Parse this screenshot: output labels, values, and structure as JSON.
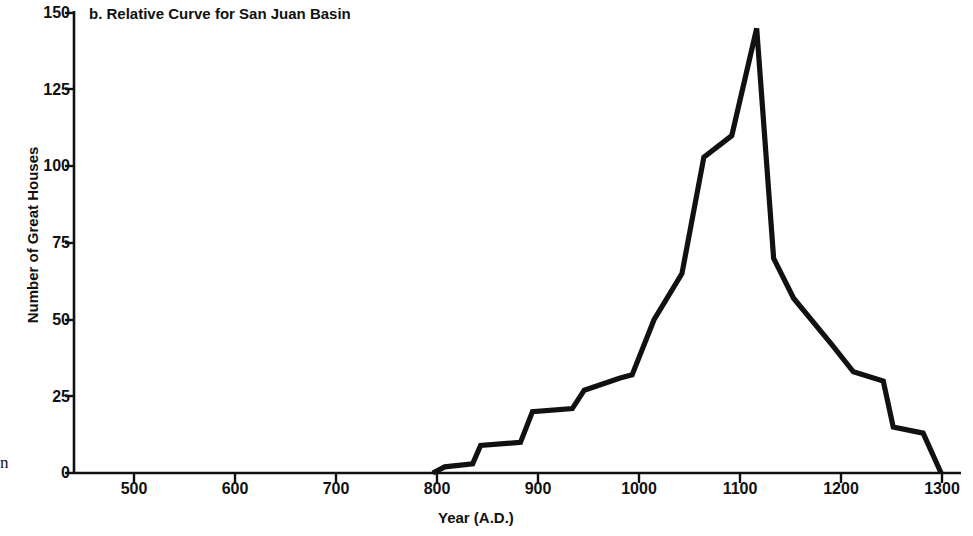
{
  "figure": {
    "panel_label": "b.",
    "title": "b. Relative Curve for San Juan Basin",
    "background_color": "#ffffff",
    "line_color": "#111111",
    "axis_color": "#111111",
    "stray_text": "n"
  },
  "axes": {
    "x": {
      "label": "Year (A.D.)",
      "ticks": [
        500,
        600,
        700,
        800,
        900,
        1000,
        1100,
        1200,
        1300
      ],
      "tick_labels": [
        "500",
        "600",
        "700",
        "800",
        "900",
        "1000",
        "1100",
        "1200",
        "1300"
      ],
      "range": [
        440,
        1330
      ]
    },
    "y": {
      "label": "Number of Great Houses",
      "ticks": [
        0,
        25,
        50,
        75,
        100,
        125,
        150
      ],
      "tick_labels": [
        "0",
        "25",
        "50",
        "75",
        "100",
        "125",
        "150"
      ],
      "range": [
        0,
        150
      ]
    }
  },
  "chart_data": {
    "type": "line",
    "title": "b. Relative Curve for San Juan Basin",
    "xlabel": "Year (A.D.)",
    "ylabel": "Number of Great Houses",
    "xlim": [
      440,
      1330
    ],
    "ylim": [
      0,
      150
    ],
    "grid": false,
    "legend": null,
    "series": [
      {
        "name": "Relative curve for San Juan Basin",
        "x": [
          800,
          812,
          840,
          848,
          888,
          900,
          940,
          952,
          988,
          1000,
          1022,
          1050,
          1072,
          1100,
          1125,
          1142,
          1162,
          1200,
          1222,
          1252,
          1262,
          1292,
          1310
        ],
        "y": [
          0,
          2,
          3,
          9,
          10,
          20,
          21,
          27,
          31,
          32,
          50,
          65,
          103,
          110,
          145,
          70,
          57,
          42,
          33,
          30,
          15,
          13,
          0
        ]
      }
    ],
    "peak": {
      "x": 1125,
      "y": 145
    }
  }
}
